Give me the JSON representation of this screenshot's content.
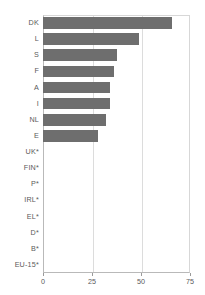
{
  "chart_data": {
    "type": "bar",
    "orientation": "horizontal",
    "title": "",
    "subtitle": "",
    "xlabel": "",
    "ylabel": "",
    "xlim": [
      0,
      75
    ],
    "xticks": [
      0,
      25,
      50,
      75
    ],
    "xtick_labels": [
      "0",
      "25",
      "50",
      "75"
    ],
    "grid": true,
    "grid_axis": "x",
    "legend": false,
    "legend_position": "none",
    "bar_color": "#6e6e6e",
    "categories": [
      "DK",
      "L",
      "S",
      "F",
      "A",
      "I",
      "NL",
      "E",
      "UK*",
      "FIN*",
      "P*",
      "IRL*",
      "EL*",
      "D*",
      "B*",
      "EU-15*"
    ],
    "values": [
      66,
      49,
      38,
      36,
      34,
      34,
      32,
      28,
      null,
      null,
      null,
      null,
      null,
      null,
      null,
      null
    ]
  }
}
